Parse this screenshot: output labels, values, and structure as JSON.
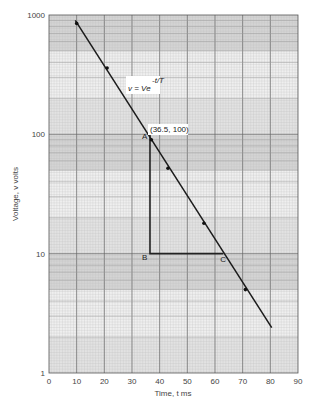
{
  "chart_data": {
    "type": "line",
    "title": "",
    "xlabel": "Time, t ms",
    "ylabel": "Voltage, v volts",
    "xlim": [
      0,
      90
    ],
    "ylim": [
      1,
      1000
    ],
    "yscale": "log",
    "grid": true,
    "x_ticks": [
      "0",
      "10",
      "20",
      "30",
      "40",
      "50",
      "60",
      "70",
      "80",
      "90"
    ],
    "y_ticks": [
      "1",
      "10",
      "100",
      "1000"
    ],
    "series": [
      {
        "name": "v = Ve^(-t/T)",
        "line": {
          "x": [
            9.5,
            80.5
          ],
          "y": [
            900,
            2.4
          ]
        },
        "points": [
          {
            "x": 10,
            "y": 850
          },
          {
            "x": 21,
            "y": 360
          },
          {
            "x": 37,
            "y": 90
          },
          {
            "x": 43,
            "y": 52
          },
          {
            "x": 56,
            "y": 18
          },
          {
            "x": 71,
            "y": 5
          }
        ]
      }
    ],
    "annotations": {
      "equation": "v = Ve",
      "exponent": "-t/T",
      "point_label": "(36.5, 100)",
      "triangle": {
        "A": {
          "label": "A",
          "x": 36.5,
          "y": 100
        },
        "B": {
          "label": "B",
          "x": 36.5,
          "y": 10
        },
        "C": {
          "label": "C",
          "x": 63,
          "y": 10
        }
      }
    }
  }
}
